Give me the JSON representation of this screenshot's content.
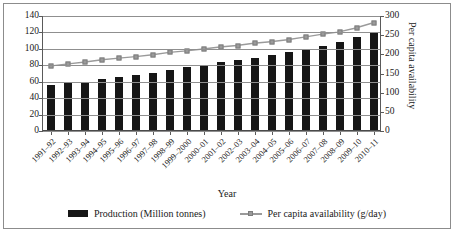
{
  "chart_data": {
    "type": "bar",
    "title": "",
    "xlabel": "Year",
    "ylabel": "",
    "y2label": "Per capita availability",
    "ylim": [
      0,
      140
    ],
    "y2lim": [
      0,
      300
    ],
    "yticks": [
      0,
      20,
      40,
      60,
      80,
      100,
      120,
      140
    ],
    "y2ticks": [
      0,
      50,
      100,
      150,
      200,
      250,
      300
    ],
    "grid": true,
    "legend_position": "bottom",
    "categories": [
      "1991–92",
      "1992–93",
      "1993–94",
      "1994–95",
      "1995–96",
      "1996–97",
      "1997–98",
      "1998–99",
      "1999–2000",
      "2000–01",
      "2001–02",
      "2002–03",
      "2003–04",
      "2004–05",
      "2005–06",
      "2006–07",
      "2007–08",
      "2008–09",
      "2009–10",
      "2010–11"
    ],
    "series": [
      {
        "name": "Production (Million tonnes)",
        "axis": "left",
        "type": "bar",
        "color": "#161616",
        "values": [
          56,
          58,
          59,
          63,
          66,
          68,
          71,
          74,
          78,
          80,
          84,
          86,
          89,
          92,
          96,
          100,
          104,
          108,
          115,
          121
        ]
      },
      {
        "name": "Per capita availability (g/day)",
        "axis": "right",
        "type": "line",
        "color": "#9a9a9a",
        "values": [
          170,
          175,
          180,
          186,
          190,
          194,
          199,
          205,
          209,
          214,
          219,
          223,
          229,
          233,
          238,
          245,
          252,
          258,
          268,
          281
        ]
      }
    ]
  },
  "legend": {
    "items": [
      {
        "label": "Production (Million tonnes)"
      },
      {
        "label": "Per capita availability (g/day)"
      }
    ]
  }
}
